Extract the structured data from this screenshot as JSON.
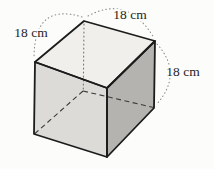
{
  "figure": {
    "shape": "cube",
    "labels": [
      {
        "text": "18 cm",
        "edge": "top-left-edge"
      },
      {
        "text": "18 cm",
        "edge": "top-right-edge"
      },
      {
        "text": "18 cm",
        "edge": "right-vertical-edge"
      }
    ],
    "colors": {
      "top_face": "#f0efeb",
      "front_face": "#dcdbd7",
      "right_face": "#b5b3af",
      "edge": "#1c1c1c",
      "hidden_edge": "#3a3a3a",
      "hidden_back_edge": "#777774",
      "arc": "#8c8c8a",
      "text": "#1f1f1d"
    }
  }
}
